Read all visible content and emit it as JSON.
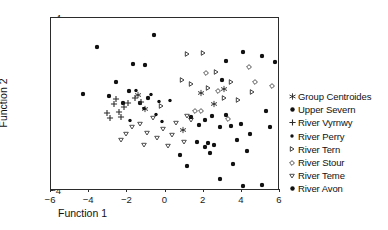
{
  "chart_data": {
    "type": "scatter",
    "title": "",
    "xlabel": "Function 1",
    "ylabel": "Function 2",
    "xlim": [
      -6,
      6
    ],
    "ylim": [
      -4,
      4
    ],
    "xticks": [
      -6,
      -4,
      -2,
      0,
      2,
      4,
      6
    ],
    "yticks": [
      -4,
      -2,
      0,
      2,
      4
    ],
    "grid": false,
    "legend_position": "right",
    "series": [
      {
        "name": "Group Centroides",
        "marker": "star",
        "fill": "none",
        "color": "#1a1a1a",
        "points": [
          [
            -1.45,
            0.42
          ],
          [
            -1.1,
            -0.22
          ],
          [
            0.9,
            -1.18
          ],
          [
            2.55,
            0.02
          ],
          [
            3.05,
            0.72
          ],
          [
            1.85,
            0.55
          ]
        ]
      },
      {
        "name": "Upper Severn",
        "marker": "circle-filled",
        "fill": "solid",
        "color": "#111111",
        "points": [
          [
            -3.6,
            2.65
          ],
          [
            -2.95,
            0.38
          ],
          [
            -4.3,
            0.48
          ],
          [
            -2.6,
            1.05
          ],
          [
            -1.7,
            1.85
          ],
          [
            -1.05,
            1.82
          ],
          [
            -0.6,
            3.2
          ],
          [
            -2.25,
            0.08
          ],
          [
            -1.35,
            0.05
          ],
          [
            -0.9,
            0.3
          ],
          [
            -1.9,
            0.62
          ]
        ]
      },
      {
        "name": "River Vyrnwy",
        "marker": "plus",
        "fill": "none",
        "color": "#2b2b2b",
        "points": [
          [
            -2.7,
            0.02
          ],
          [
            -2.45,
            -0.35
          ],
          [
            -3.05,
            -0.4
          ],
          [
            -2.9,
            -0.62
          ],
          [
            -2.35,
            -0.58
          ],
          [
            -1.95,
            0.08
          ],
          [
            -1.6,
            0.3
          ],
          [
            -2.15,
            -0.12
          ],
          [
            -1.3,
            0.12
          ],
          [
            -2.6,
            0.25
          ]
        ]
      },
      {
        "name": "River Perry",
        "marker": "circle-filled-sm",
        "fill": "solid",
        "color": "#111111",
        "points": [
          [
            -1.55,
            0.68
          ],
          [
            -0.75,
            0.5
          ],
          [
            -0.35,
            0.18
          ],
          [
            -1.15,
            -0.18
          ],
          [
            -0.5,
            -0.45
          ],
          [
            0.25,
            0.22
          ],
          [
            -1.85,
            -0.72
          ],
          [
            -0.2,
            -0.75
          ]
        ]
      },
      {
        "name": "River Tern",
        "marker": "triangle-right",
        "fill": "none",
        "color": "#2b2b2b",
        "points": [
          [
            1.15,
            2.32
          ],
          [
            1.95,
            2.38
          ],
          [
            0.85,
            1.12
          ],
          [
            1.35,
            0.95
          ],
          [
            3.05,
            0.28
          ],
          [
            2.65,
            1.48
          ],
          [
            3.45,
            1.02
          ],
          [
            4.55,
            0.6
          ],
          [
            2.25,
            0.75
          ],
          [
            -0.25,
            -0.05
          ],
          [
            3.8,
            0.2
          ]
        ]
      },
      {
        "name": "River Stour",
        "marker": "diamond",
        "fill": "none",
        "color": "#3a3a3a",
        "points": [
          [
            4.35,
            1.72
          ],
          [
            4.7,
            1.05
          ],
          [
            2.75,
            0.62
          ],
          [
            1.55,
            -0.32
          ],
          [
            1.85,
            -0.3
          ],
          [
            3.25,
            -0.68
          ],
          [
            2.1,
            1.45
          ],
          [
            5.6,
            0.85
          ]
        ]
      },
      {
        "name": "River Teme",
        "marker": "triangle-down",
        "fill": "none",
        "color": "#3a3a3a",
        "points": [
          [
            -1.35,
            -0.92
          ],
          [
            -0.95,
            -1.32
          ],
          [
            -0.45,
            -1.55
          ],
          [
            -1.75,
            -1.05
          ],
          [
            -2.05,
            -1.38
          ],
          [
            -1.15,
            -1.85
          ],
          [
            -0.15,
            -1.12
          ],
          [
            0.35,
            -1.42
          ],
          [
            0.55,
            -0.85
          ],
          [
            0.15,
            -1.92
          ],
          [
            0.95,
            -1.75
          ],
          [
            -0.65,
            -0.62
          ],
          [
            1.15,
            -0.55
          ],
          [
            1.35,
            -0.72
          ],
          [
            -2.35,
            -1.62
          ]
        ]
      },
      {
        "name": "River Avon",
        "marker": "circle-filled",
        "fill": "solid",
        "color": "#111111",
        "points": [
          [
            1.35,
            -0.58
          ],
          [
            2.05,
            -0.72
          ],
          [
            1.75,
            -0.95
          ],
          [
            2.45,
            -0.52
          ],
          [
            3.15,
            -0.48
          ],
          [
            3.45,
            -0.98
          ],
          [
            2.85,
            -1.05
          ],
          [
            3.95,
            -0.9
          ],
          [
            1.65,
            -1.72
          ],
          [
            2.25,
            -1.78
          ],
          [
            2.05,
            -1.95
          ],
          [
            2.55,
            -1.88
          ],
          [
            2.35,
            -2.25
          ],
          [
            4.25,
            -2.15
          ],
          [
            3.55,
            -2.75
          ],
          [
            2.85,
            -3.45
          ],
          [
            4.05,
            -3.75
          ],
          [
            5.05,
            -3.72
          ],
          [
            4.45,
            -1.35
          ],
          [
            5.25,
            -0.28
          ],
          [
            3.15,
            2.02
          ],
          [
            4.05,
            2.42
          ],
          [
            5.05,
            2.25
          ],
          [
            5.75,
            1.95
          ],
          [
            2.95,
            1.12
          ],
          [
            3.75,
            -1.65
          ],
          [
            1.15,
            -2.85
          ],
          [
            5.45,
            -1.05
          ],
          [
            0.75,
            -2.35
          ]
        ]
      }
    ]
  },
  "legend": {
    "items": [
      {
        "label": "Group Centroides",
        "marker": "star"
      },
      {
        "label": "Upper Severn",
        "marker": "circle-filled"
      },
      {
        "label": "River Vyrnwy",
        "marker": "plus"
      },
      {
        "label": "River Perry",
        "marker": "circle-filled-sm"
      },
      {
        "label": "River Tern",
        "marker": "triangle-right"
      },
      {
        "label": "River Stour",
        "marker": "diamond"
      },
      {
        "label": "River Teme",
        "marker": "triangle-down"
      },
      {
        "label": "River Avon",
        "marker": "circle-filled"
      }
    ]
  }
}
